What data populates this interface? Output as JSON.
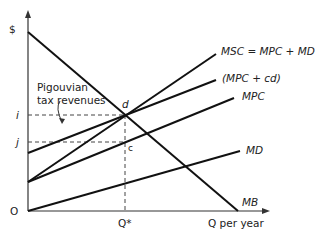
{
  "diagram": {
    "y_axis_label": "$",
    "x_axis_label": "Q per year",
    "origin_label": "O",
    "q_star_label": "Q*",
    "price_labels": {
      "i": "i",
      "j": "j"
    },
    "points": {
      "d": "d",
      "c": "c"
    },
    "annotation": {
      "line1": "Pigouvian",
      "line2": "tax revenues"
    },
    "curves": {
      "msc": "MSC = MPC + MD",
      "mpc_cd": "(MPC + cd)",
      "mpc": "MPC",
      "md": "MD",
      "mb": "MB"
    }
  }
}
